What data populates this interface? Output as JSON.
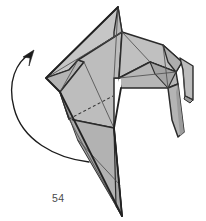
{
  "figure": {
    "kind": "origami-folding-diagram",
    "step_number": "54",
    "caption": "54",
    "background_color": "#ffffff",
    "paper": {
      "fill_light": "#c2c2c2",
      "fill_mid": "#b0b0b0",
      "fill_dark": "#9e9e9e",
      "fill_deep": "#8f8f8f",
      "outline_color": "#2b2b2b",
      "crease_color": "#545454",
      "outline_width": 1.6,
      "crease_width": 0.8
    },
    "fold_line": {
      "type": "valley-fold",
      "style": "dashed",
      "color": "#3a3a3a",
      "dash_pattern": "3,2.4",
      "from": [
        69,
        119
      ],
      "to": [
        113,
        96
      ]
    },
    "action_arrow": {
      "type": "curved-rotate-arrow",
      "direction": "counter-clockwise-upward",
      "color": "#1c1c1c",
      "stroke_width": 1.3,
      "tail": [
        89,
        162
      ],
      "head": [
        32,
        51
      ],
      "head_angle_deg": -52,
      "description": "large curved arrow sweeping from lower right up to upper left indicating the model is rotated / flap swung upward"
    },
    "shapes": {
      "main_body": "large kite-shaped folded form with peaked apex at top centre and a long narrow point descending to the bottom right",
      "right_wing": "layered flap folded to the right of the peak",
      "right_leg": "narrow tapered leg hanging from the right wing",
      "right_tab": "thin vertical tab at the far right edge",
      "notch": "white cut-out notch below the peak separating body from right wing"
    },
    "geometry": {
      "apex": [
        118,
        7
      ],
      "left_vertex": [
        46,
        78
      ],
      "bottom_point": [
        122,
        216
      ],
      "notch_corner": [
        119,
        78
      ],
      "right_extent": [
        193,
        100
      ]
    }
  }
}
